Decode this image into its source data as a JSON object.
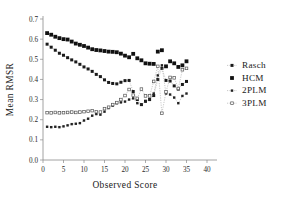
{
  "chart_data": {
    "type": "scatter",
    "title": "",
    "xlabel": "Observed Score",
    "ylabel": "Mean RMSR",
    "xlim": [
      0,
      40
    ],
    "ylim": [
      0.0,
      0.7
    ],
    "xticks": [
      "0",
      "5",
      "10",
      "15",
      "20",
      "25",
      "30",
      "35",
      "40"
    ],
    "xtick_values": [
      0,
      5,
      10,
      15,
      20,
      25,
      30,
      35,
      40
    ],
    "yticks": [
      "0.0",
      "0.1",
      "0.2",
      "0.3",
      "0.4",
      "0.5",
      "0.6",
      "0.7"
    ],
    "ytick_values": [
      0.0,
      0.1,
      0.2,
      0.3,
      0.4,
      0.5,
      0.6,
      0.7
    ],
    "grid": false,
    "legend_position": "right",
    "legend": [
      "Rasch",
      "HCM",
      "2PLM",
      "3PLM"
    ],
    "series": [
      {
        "name": "Rasch",
        "marker": "small-dot",
        "line": "dotted",
        "x": [
          1,
          2,
          3,
          4,
          5,
          6,
          7,
          8,
          9,
          10,
          11,
          12,
          13,
          14,
          15,
          16,
          17,
          18,
          19,
          20,
          21,
          22,
          23,
          24,
          25,
          26,
          27,
          28,
          29,
          30,
          31,
          32,
          33,
          34,
          35
        ],
        "values": [
          0.575,
          0.56,
          0.545,
          0.53,
          0.52,
          0.508,
          0.497,
          0.487,
          0.475,
          0.462,
          0.452,
          0.44,
          0.425,
          0.414,
          0.398,
          0.385,
          0.38,
          0.378,
          0.386,
          0.394,
          0.395,
          0.34,
          0.3,
          0.275,
          0.292,
          0.3,
          0.32,
          0.4,
          0.455,
          0.395,
          0.392,
          0.368,
          0.352,
          0.375,
          0.39
        ]
      },
      {
        "name": "HCM",
        "marker": "filled-square",
        "line": "none",
        "x": [
          1,
          2,
          3,
          4,
          5,
          6,
          7,
          8,
          9,
          10,
          11,
          12,
          13,
          14,
          15,
          16,
          17,
          18,
          19,
          20,
          21,
          22,
          23,
          24,
          25,
          26,
          27,
          28,
          29,
          30,
          31,
          32,
          33,
          34,
          35
        ],
        "values": [
          0.63,
          0.622,
          0.612,
          0.605,
          0.6,
          0.598,
          0.588,
          0.578,
          0.572,
          0.566,
          0.558,
          0.55,
          0.546,
          0.544,
          0.541,
          0.538,
          0.537,
          0.535,
          0.528,
          0.518,
          0.51,
          0.527,
          0.505,
          0.495,
          0.48,
          0.478,
          0.477,
          0.538,
          0.545,
          0.465,
          0.49,
          0.48,
          0.462,
          0.47,
          0.49
        ]
      },
      {
        "name": "2PLM",
        "marker": "tiny-dot",
        "line": "dotted",
        "x": [
          1,
          2,
          3,
          4,
          5,
          6,
          7,
          8,
          9,
          10,
          11,
          12,
          13,
          14,
          15,
          16,
          17,
          18,
          19,
          20,
          21,
          22,
          23,
          24,
          25,
          26,
          27,
          28,
          29,
          30,
          31,
          32,
          33,
          34,
          35
        ],
        "values": [
          0.165,
          0.163,
          0.165,
          0.163,
          0.167,
          0.172,
          0.178,
          0.18,
          0.183,
          0.196,
          0.205,
          0.22,
          0.228,
          0.225,
          0.24,
          0.258,
          0.27,
          0.282,
          0.286,
          0.29,
          0.3,
          0.306,
          0.282,
          0.275,
          0.29,
          0.302,
          0.33,
          0.42,
          0.47,
          0.33,
          0.325,
          0.31,
          0.282,
          0.318,
          0.33
        ]
      },
      {
        "name": "3PLM",
        "marker": "open-dot",
        "line": "dashed-dotted",
        "x": [
          1,
          2,
          3,
          4,
          5,
          6,
          7,
          8,
          9,
          10,
          11,
          12,
          13,
          14,
          15,
          16,
          17,
          18,
          19,
          20,
          21,
          22,
          23,
          24,
          25,
          26,
          27,
          28,
          29,
          30,
          31,
          32,
          33,
          34,
          35
        ],
        "values": [
          0.235,
          0.234,
          0.236,
          0.234,
          0.235,
          0.236,
          0.238,
          0.236,
          0.238,
          0.24,
          0.242,
          0.245,
          0.24,
          0.238,
          0.255,
          0.262,
          0.275,
          0.285,
          0.3,
          0.32,
          0.35,
          0.322,
          0.306,
          0.352,
          0.318,
          0.318,
          0.39,
          0.465,
          0.232,
          0.338,
          0.41,
          0.408,
          0.355,
          0.448,
          0.455
        ]
      }
    ]
  }
}
